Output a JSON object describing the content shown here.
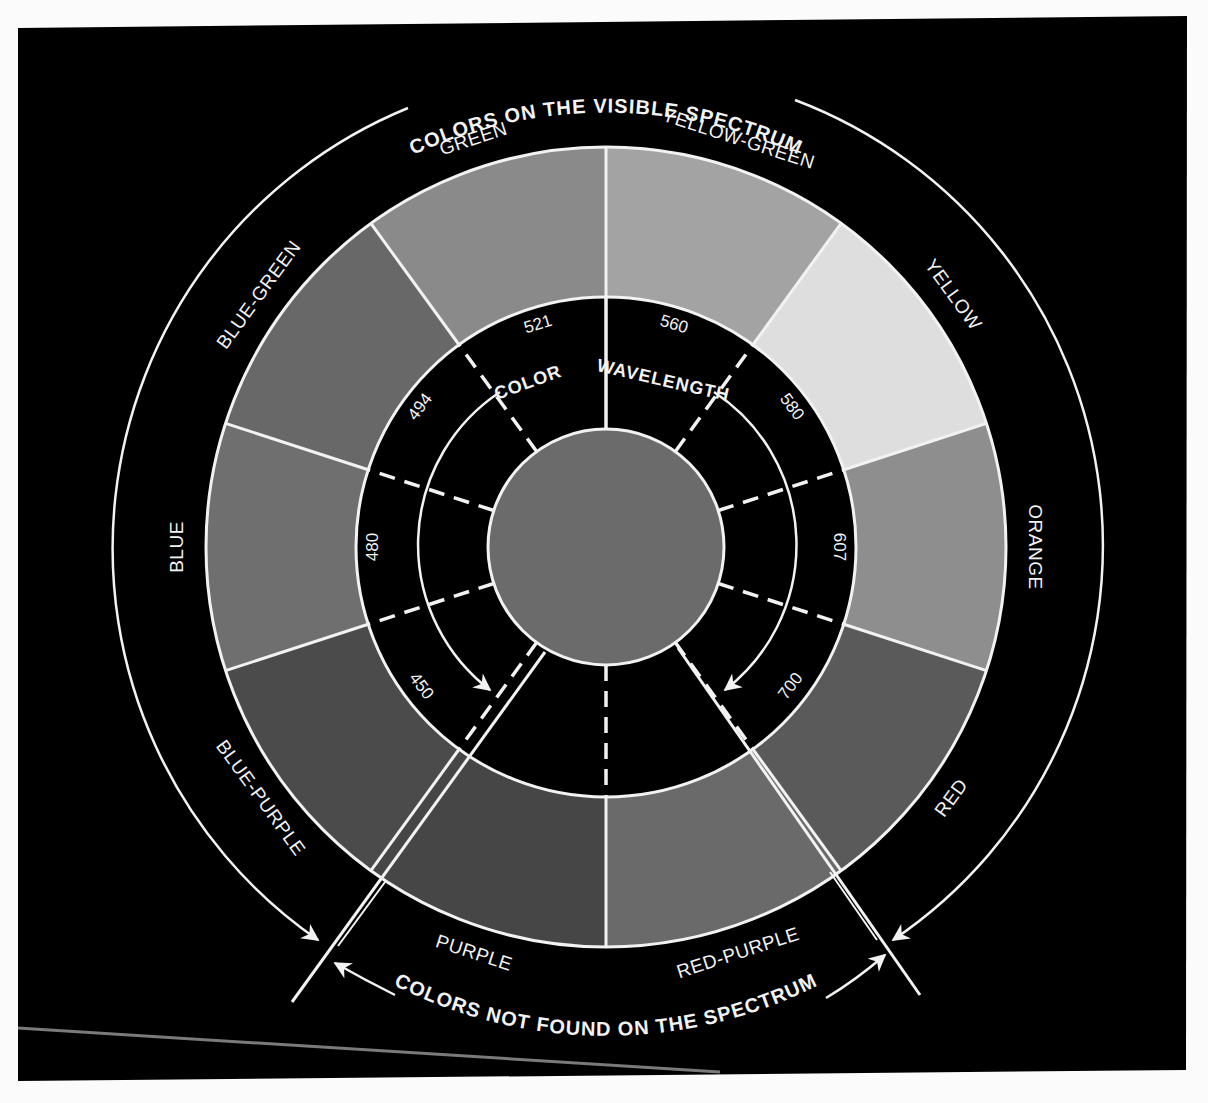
{
  "diagram": {
    "title_top": "COLORS ON THE VISIBLE SPECTRUM",
    "title_bottom": "COLORS NOT FOUND ON THE SPECTRUM",
    "inner_title_left": "COLOR",
    "inner_title_right": "WAVELENGTH",
    "geometry": {
      "center": [
        606,
        547
      ],
      "outer_arc_radius": 476,
      "ring_outer_radius": 400,
      "ring_inner_radius": 250,
      "guide_ring_radius": 183,
      "core_radius": 118,
      "segment_angle_deg": 36
    },
    "segments": [
      {
        "name": "GREEN",
        "start": -36,
        "end": 0,
        "tone": "#8a8a8a"
      },
      {
        "name": "YELLOW-GREEN",
        "start": 0,
        "end": 36,
        "tone": "#a3a3a3"
      },
      {
        "name": "YELLOW",
        "start": 36,
        "end": 72,
        "tone": "#dedede"
      },
      {
        "name": "ORANGE",
        "start": 72,
        "end": 108,
        "tone": "#8e8e8e"
      },
      {
        "name": "RED",
        "start": 108,
        "end": 144,
        "tone": "#5a5a5a"
      },
      {
        "name": "RED-PURPLE",
        "start": 144,
        "end": 180,
        "tone": "#6a6a6a"
      },
      {
        "name": "PURPLE",
        "start": 180,
        "end": 216,
        "tone": "#464646"
      },
      {
        "name": "BLUE-PURPLE",
        "start": 216,
        "end": 252,
        "tone": "#4b4b4b"
      },
      {
        "name": "BLUE",
        "start": 252,
        "end": 288,
        "tone": "#6f6f6f"
      },
      {
        "name": "BLUE-GREEN",
        "start": 288,
        "end": 324,
        "tone": "#686868"
      }
    ],
    "core_tone": "#6b6b6b",
    "wavelengths": [
      {
        "value": "521",
        "angle": -17
      },
      {
        "value": "560",
        "angle": 17
      },
      {
        "value": "580",
        "angle": 53
      },
      {
        "value": "607",
        "angle": 90
      },
      {
        "value": "700",
        "angle": 127
      },
      {
        "value": "450",
        "angle": -127
      },
      {
        "value": "480",
        "angle": -90
      },
      {
        "value": "494",
        "angle": -53
      }
    ]
  }
}
